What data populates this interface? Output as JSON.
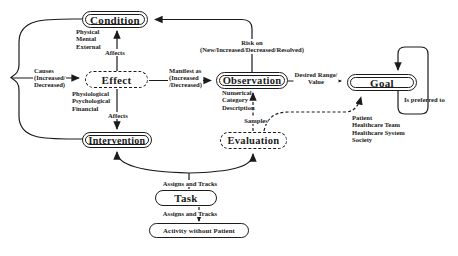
{
  "figure": {
    "background": "#ffffff",
    "ink": "#1b1b1b",
    "nodes": {
      "condition": {
        "label": "Condition",
        "style": "double-solid"
      },
      "effect": {
        "label": "Effect",
        "style": "dashed"
      },
      "observation": {
        "label": "Observation",
        "style": "double-solid"
      },
      "goal": {
        "label": "Goal",
        "style": "double-solid"
      },
      "intervention": {
        "label": "Intervention",
        "style": "double-solid"
      },
      "evaluation": {
        "label": "Evaluation",
        "style": "dashed"
      },
      "task": {
        "label": "Task",
        "style": "solid"
      },
      "activity": {
        "label": "Activity without Patient",
        "style": "solid"
      }
    },
    "annotations": {
      "condition_aspects": [
        "Physical",
        "Mental",
        "External"
      ],
      "effect_aspects": [
        "Physiological",
        "Psychological",
        "Financial"
      ],
      "observation_aspects": [
        "Numerical",
        "Category",
        "Description"
      ],
      "goal_stakeholders": [
        "Patient",
        "Healthcare Team",
        "Healthcare System",
        "Society"
      ]
    },
    "edges": {
      "affects_condition": "Affects",
      "affects_intervention": "Affects",
      "causes": [
        "Causes",
        "(Increased/",
        "Decreased)"
      ],
      "manifest": [
        "Manifest as",
        "(Increased",
        "/Decreased)"
      ],
      "risk": [
        "Risk on",
        "(New/Increased/Decreased/Resolved)"
      ],
      "desired": [
        "Desired Range/",
        "Value"
      ],
      "preferred": "Is preferred to",
      "samples": "Samples",
      "assigns_tracks_upper": "Assigns and Tracks",
      "assigns_tracks_lower": "Assigns and Tracks"
    }
  }
}
